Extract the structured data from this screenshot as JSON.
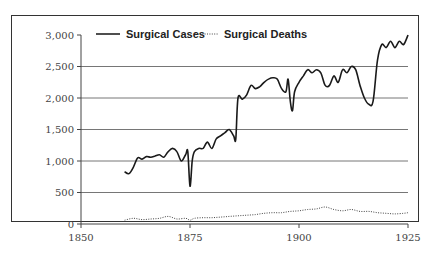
{
  "chart_data": {
    "type": "line",
    "title": "",
    "xlabel": "",
    "ylabel": "",
    "xlim": [
      1850,
      1925
    ],
    "ylim": [
      0,
      3000
    ],
    "grid": {
      "horizontal": true,
      "vertical": false
    },
    "legend_position": "top",
    "x_ticks": [
      "1850",
      "1875",
      "1900",
      "1925"
    ],
    "y_ticks": [
      "0",
      "500",
      "1,000",
      "1,500",
      "2,000",
      "2,500",
      "3,000"
    ],
    "series": [
      {
        "name": "Surgical Cases",
        "style": "solid",
        "x": [
          1860,
          1861,
          1862,
          1863,
          1864,
          1865,
          1866,
          1867,
          1868,
          1869,
          1870,
          1871,
          1872,
          1873,
          1874,
          1874.5,
          1875,
          1875.5,
          1876,
          1877,
          1878,
          1879,
          1880,
          1881,
          1882,
          1883,
          1884,
          1885,
          1885.5,
          1886,
          1887,
          1888,
          1889,
          1890,
          1891,
          1892,
          1893,
          1894,
          1895,
          1896,
          1897,
          1897.5,
          1898,
          1898.5,
          1899,
          1900,
          1901,
          1902,
          1903,
          1904,
          1905,
          1906,
          1907,
          1908,
          1909,
          1910,
          1911,
          1912,
          1913,
          1914,
          1915,
          1916,
          1917,
          1918,
          1919,
          1920,
          1921,
          1922,
          1923,
          1924,
          1925
        ],
        "values": [
          830,
          800,
          900,
          1050,
          1030,
          1070,
          1060,
          1080,
          1100,
          1060,
          1150,
          1200,
          1150,
          1000,
          1100,
          1150,
          600,
          1000,
          1150,
          1200,
          1200,
          1300,
          1200,
          1350,
          1400,
          1450,
          1500,
          1400,
          1350,
          2000,
          1980,
          2050,
          2200,
          2150,
          2180,
          2250,
          2300,
          2320,
          2300,
          2150,
          2100,
          2300,
          1950,
          1800,
          2100,
          2250,
          2350,
          2450,
          2400,
          2450,
          2400,
          2200,
          2200,
          2350,
          2250,
          2450,
          2400,
          2500,
          2450,
          2200,
          2000,
          1900,
          1950,
          2600,
          2850,
          2800,
          2900,
          2800,
          2900,
          2850,
          3000
        ]
      },
      {
        "name": "Surgical Deaths",
        "style": "dotted",
        "x": [
          1860,
          1862,
          1864,
          1866,
          1868,
          1870,
          1872,
          1874,
          1875,
          1876,
          1878,
          1880,
          1882,
          1884,
          1886,
          1888,
          1890,
          1892,
          1894,
          1896,
          1898,
          1900,
          1902,
          1904,
          1906,
          1908,
          1910,
          1912,
          1914,
          1916,
          1918,
          1920,
          1922,
          1924,
          1925
        ],
        "values": [
          60,
          90,
          70,
          80,
          90,
          120,
          80,
          90,
          60,
          90,
          100,
          100,
          110,
          120,
          130,
          140,
          150,
          170,
          180,
          180,
          200,
          210,
          230,
          240,
          270,
          230,
          210,
          230,
          200,
          200,
          180,
          170,
          160,
          170,
          180
        ]
      }
    ]
  },
  "legend": {
    "cases_label": "Surgical Cases",
    "deaths_label": "Surgical Deaths"
  }
}
